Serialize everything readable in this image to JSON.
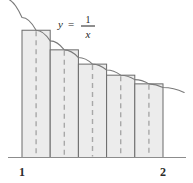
{
  "figure": {
    "function_label": {
      "y": "y",
      "equals": "=",
      "numerator": "1",
      "denominator": "x"
    },
    "axis_tick_labels": {
      "left": "1",
      "right": "2"
    },
    "colors": {
      "rect_fill": "#ececec",
      "rect_stroke": "#6b6b6b",
      "dashed_stroke": "#a8a8a8",
      "curve_stroke": "#7a7a7a",
      "axis_stroke": "#8c8c8c",
      "text": "#2b2b2b",
      "background": "#ffffff"
    }
  },
  "chart_data": {
    "type": "area",
    "xlabel": "x",
    "ylabel": "y",
    "function": "y = 1/x",
    "xlim": [
      1,
      2
    ],
    "ylim": [
      0,
      1.05
    ],
    "grid": false,
    "legend": "none",
    "annotations": [
      "y = 1/x"
    ],
    "method": "midpoint-rule",
    "n_rectangles": 5,
    "interval": [
      1,
      2
    ],
    "delta_x": 0.2,
    "rectangles": [
      {
        "index": 1,
        "x_left": 1.0,
        "x_right": 1.2,
        "midpoint": 1.1,
        "height": 0.909
      },
      {
        "index": 2,
        "x_left": 1.2,
        "x_right": 1.4,
        "midpoint": 1.3,
        "height": 0.769
      },
      {
        "index": 3,
        "x_left": 1.4,
        "x_right": 1.6,
        "midpoint": 1.5,
        "height": 0.667
      },
      {
        "index": 4,
        "x_left": 1.6,
        "x_right": 1.8,
        "midpoint": 1.7,
        "height": 0.588
      },
      {
        "index": 5,
        "x_left": 1.8,
        "x_right": 2.0,
        "midpoint": 1.9,
        "height": 0.526
      }
    ],
    "midpoints": [
      1.1,
      1.3,
      1.5,
      1.7,
      1.9
    ],
    "values": [
      0.909,
      0.769,
      0.667,
      0.588,
      0.526
    ],
    "curve_x": [
      0.88,
      1.0,
      1.1,
      1.2,
      1.3,
      1.4,
      1.5,
      1.6,
      1.7,
      1.8,
      1.9,
      2.0,
      2.15
    ],
    "curve_y": [
      1.136,
      1.0,
      0.909,
      0.833,
      0.769,
      0.714,
      0.667,
      0.625,
      0.588,
      0.556,
      0.526,
      0.5,
      0.465
    ]
  }
}
